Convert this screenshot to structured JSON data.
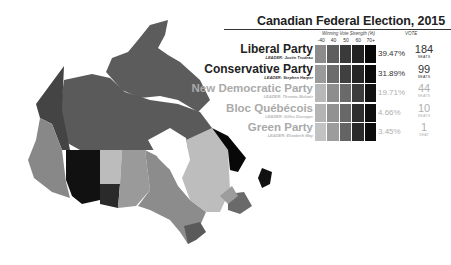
{
  "title": "Canadian Federal Election, 2015",
  "legend": {
    "strength_label": "Winning Vote Strength (%)",
    "vote_label": "VOTE",
    "ticks": [
      "-40",
      "40",
      "50",
      "60",
      "70+"
    ]
  },
  "parties": [
    {
      "name": "Liberal Party",
      "leader": "LEADER: Justin Trudeau",
      "vote": "39.47%",
      "seats": "184",
      "seats_label": "SEATS",
      "text_color": "#222222",
      "leader_color": "#333333",
      "size": 12,
      "swatches": [
        "#8c8c8c",
        "#5e5e5e",
        "#3a3a3a",
        "#222222",
        "#080808"
      ]
    },
    {
      "name": "Conservative Party",
      "leader": "LEADER: Stephen Harper",
      "vote": "31.89%",
      "seats": "99",
      "seats_label": "SEATS",
      "text_color": "#222222",
      "leader_color": "#333333",
      "size": 12,
      "swatches": [
        "#9a9a9a",
        "#6c6c6c",
        "#404040",
        "#252525",
        "#0a0a0a"
      ]
    },
    {
      "name": "New Democratic Party",
      "leader": "LEADER: Thomas Mulcair",
      "vote": "19.71%",
      "seats": "44",
      "seats_label": "SEATS",
      "text_color": "#aaaaaa",
      "leader_color": "#b5b5b5",
      "size": 11.5,
      "swatches": [
        "#b8b8b8",
        "#8e8e8e",
        "#6a6a6a",
        "#3c3c3c",
        "#121212"
      ]
    },
    {
      "name": "Bloc Québécois",
      "leader": "LEADER: Gilles Duceppe",
      "vote": "4.66%",
      "seats": "10",
      "seats_label": "SEATS",
      "text_color": "#aaaaaa",
      "leader_color": "#b5b5b5",
      "size": 11.5,
      "swatches": [
        "#b4b4b4",
        "#929292",
        "#686868",
        "#2e2e2e",
        "#0e0e0e"
      ]
    },
    {
      "name": "Green Party",
      "leader": "LEADER: Elizabeth May",
      "vote": "3.45%",
      "seats": "1",
      "seats_label": "SEAT",
      "text_color": "#aaaaaa",
      "leader_color": "#b5b5b5",
      "size": 11.5,
      "swatches": [
        "#c2c2c2",
        "#9c9c9c",
        "#646464",
        "#2a2a2a",
        "#0c0c0c"
      ]
    }
  ],
  "map": {
    "description": "Choropleth map of Canada by riding, shaded by winning vote strength",
    "colors": {
      "north": "#5a5a5a",
      "yukon": "#454545",
      "alberta": "#111111",
      "bc": "#8a8a8a",
      "sask": "#bcbcbc",
      "manitoba": "#9a9a9a",
      "ontario": "#8e8e8e",
      "quebec": "#bdbdbd",
      "labrador": "#080808",
      "maritimes": "#6a6a6a"
    }
  }
}
